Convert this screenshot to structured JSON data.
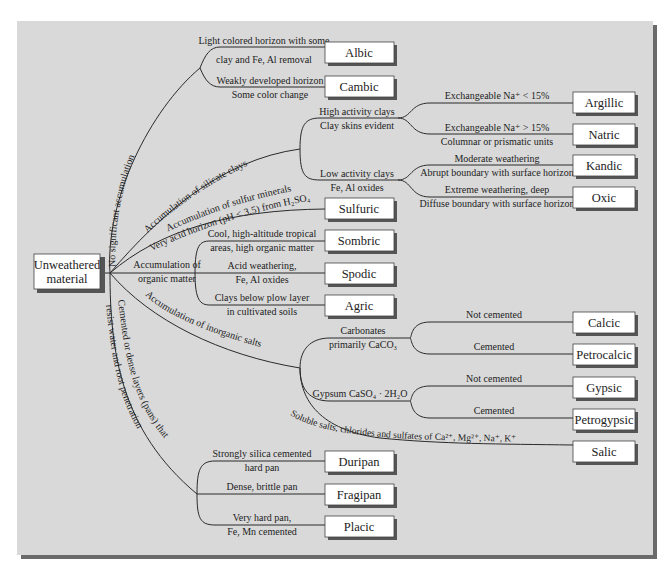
{
  "root": {
    "line1": "Unweathered",
    "line2": "material"
  },
  "branches": {
    "no_accumulation": "No significant accumulation",
    "silicate_clays": "Accumulation of silicate clays",
    "sulfur_1": "Accumulation of sulfur minerals",
    "sulfur_2": "Very acid horizon (pH < 3.5) from H₂SO₄",
    "organic_1": "Accumulation of",
    "organic_2": "organic matter",
    "inorganic_salts": "Accumulation of inorganic salts",
    "pans_1": "Cemented or dense layers (pans) that",
    "pans_2": "resist water and root penetration"
  },
  "labels": {
    "albic_1": "Light colored horizon with some",
    "albic_2": "clay and Fe, Al removal",
    "cambic_1": "Weakly developed horizon",
    "cambic_2": "Some color change",
    "high_act_1": "High activity clays",
    "high_act_2": "Clay skins evident",
    "argillic_1": "Exchangeable Na⁺ < 15%",
    "natric_1": "Exchangeable Na⁺ > 15%",
    "natric_2": "Columnar or prismatic units",
    "low_act_1": "Low activity clays",
    "low_act_2": "Fe, Al oxides",
    "kandic_1": "Moderate weathering",
    "kandic_2": "Abrupt boundary with surface horizon",
    "oxic_1": "Extreme weathering, deep",
    "oxic_2": "Diffuse boundary with surface horizon",
    "sombric_1": "Cool, high-altitude tropical",
    "sombric_2": "areas, high organic matter",
    "spodic_1": "Acid weathering,",
    "spodic_2": "Fe, Al oxides",
    "agric_1": "Clays below plow layer",
    "agric_2": "in cultivated soils",
    "carb_1": "Carbonates",
    "carb_2": "primarily CaCO₃",
    "calcic_1": "Not cemented",
    "petrocalcic_1": "Cemented",
    "gypsum_1": "Gypsum CaSO₄ · 2H₂O",
    "gypsic_1": "Not cemented",
    "petrogypsic_1": "Cemented",
    "salic_1": "Soluble salts, chlorides and sulfates of Ca²⁺, Mg²⁺, Na⁺, K⁺",
    "duripan_1": "Strongly silica cemented",
    "duripan_2": "hard pan",
    "fragipan_1": "Dense, brittle pan",
    "placic_1": "Very hard pan,",
    "placic_2": "Fe, Mn cemented"
  },
  "horizons": {
    "albic": "Albic",
    "cambic": "Cambic",
    "argillic": "Argillic",
    "natric": "Natric",
    "kandic": "Kandic",
    "oxic": "Oxic",
    "sulfuric": "Sulfuric",
    "sombric": "Sombric",
    "spodic": "Spodic",
    "agric": "Agric",
    "calcic": "Calcic",
    "petrocalcic": "Petrocalcic",
    "gypsic": "Gypsic",
    "petrogypsic": "Petrogypsic",
    "salic": "Salic",
    "duripan": "Duripan",
    "fragipan": "Fragipan",
    "placic": "Placic"
  }
}
